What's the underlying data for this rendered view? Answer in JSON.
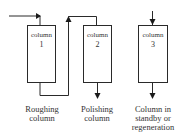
{
  "diagram": {
    "columns": [
      {
        "id": "1",
        "label": "column",
        "number": "1",
        "caption": [
          "Roughing",
          "column"
        ]
      },
      {
        "id": "2",
        "label": "column",
        "number": "2",
        "caption": [
          "Polishing",
          "column"
        ]
      },
      {
        "id": "3",
        "label": "column",
        "number": "3",
        "caption": [
          "Column in",
          "standby or",
          "regeneration"
        ]
      }
    ],
    "connections": [
      {
        "from": "inlet",
        "to": "column-1"
      },
      {
        "from": "column-1",
        "to": "column-2"
      },
      {
        "from": "column-2",
        "to": "outlet"
      },
      {
        "from": "inlet",
        "to": "column-3"
      },
      {
        "from": "column-3",
        "to": "outlet"
      }
    ],
    "colors": {
      "stroke": "#2a2a2a",
      "text": "#333333",
      "background": "#ffffff"
    }
  }
}
